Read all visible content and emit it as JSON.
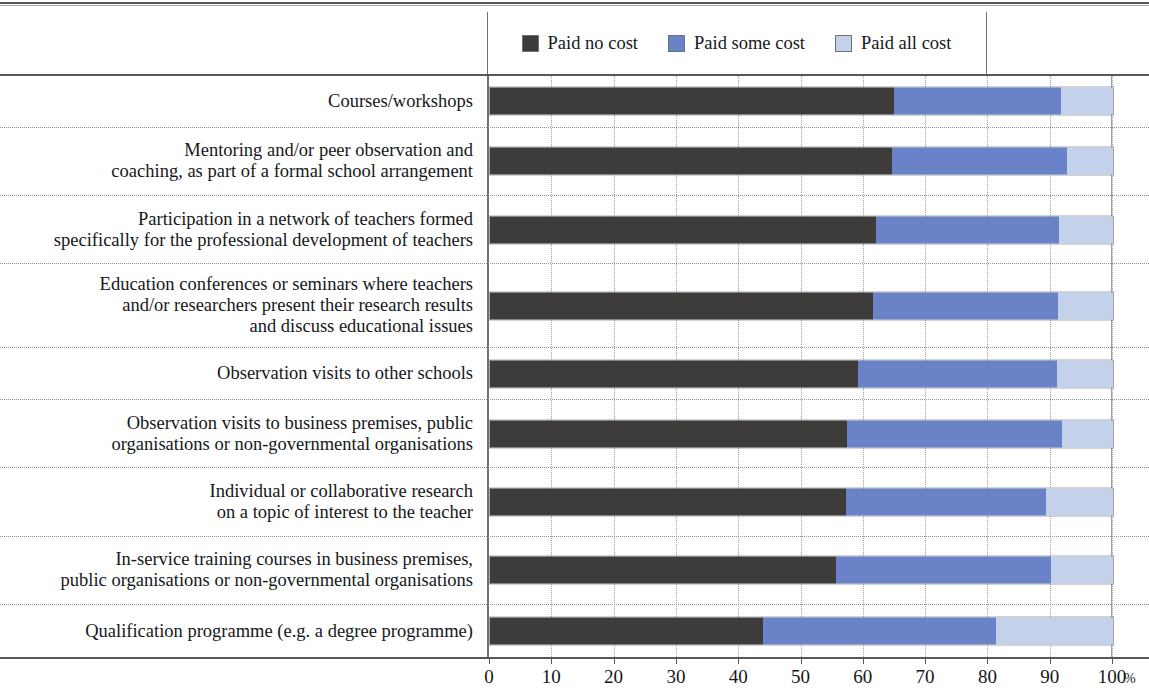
{
  "legend": {
    "items": [
      {
        "label": "Paid no cost",
        "color": "#3e3c3a",
        "icon": "legend-swatch-paid-no-cost"
      },
      {
        "label": "Paid some cost",
        "color": "#6a82c8",
        "icon": "legend-swatch-paid-some-cost"
      },
      {
        "label": "Paid all cost",
        "color": "#c3d2ea",
        "icon": "legend-swatch-paid-all-cost"
      }
    ]
  },
  "axis": {
    "unit": "%",
    "ticks": [
      "0",
      "10",
      "20",
      "30",
      "40",
      "50",
      "60",
      "70",
      "80",
      "90",
      "100"
    ]
  },
  "chart_data": {
    "type": "bar",
    "orientation": "horizontal",
    "stacked": true,
    "stack_total": 100,
    "title": "",
    "subtitle": "",
    "xlabel": "%",
    "ylabel": "",
    "xlim": [
      0,
      100
    ],
    "xticks": [
      0,
      10,
      20,
      30,
      40,
      50,
      60,
      70,
      80,
      90,
      100
    ],
    "grid": "vertical-dotted",
    "legend_position": "top-center",
    "categories": [
      "Courses/workshops",
      "Mentoring and/or peer observation and coaching, as part of a formal school arrangement",
      "Participation in a network of teachers formed specifically for the professional development of teachers",
      "Education conferences or seminars where teachers and/or researchers present their research results and discuss educational issues",
      "Observation visits to other schools",
      "Observation visits to business premises, public organisations or non-governmental organisations",
      "Individual or collaborative research on a topic of interest to the teacher",
      "In-service training courses in business premises, public organisations or non-governmental organisations",
      "Qualification programme (e.g. a degree programme)"
    ],
    "category_lines": [
      [
        "Courses/workshops"
      ],
      [
        "Mentoring and/or peer observation and",
        "coaching, as part of a formal school arrangement"
      ],
      [
        "Participation in a network of teachers formed",
        "specifically for the professional development of teachers"
      ],
      [
        "Education conferences or seminars where teachers",
        "and/or researchers present their research results",
        "and discuss educational issues"
      ],
      [
        "Observation visits to other schools"
      ],
      [
        "Observation visits to business premises, public",
        "organisations or non-governmental organisations"
      ],
      [
        "Individual or collaborative research",
        "on a topic of interest to the teacher"
      ],
      [
        "In-service training courses in business premises,",
        "public organisations or non-governmental organisations"
      ],
      [
        "Qualification programme (e.g. a degree programme)"
      ]
    ],
    "series": [
      {
        "name": "Paid no cost",
        "color": "#3e3c3a",
        "values": [
          64.8,
          64.6,
          61.9,
          61.4,
          59.1,
          57.3,
          57.1,
          55.6,
          43.8
        ]
      },
      {
        "name": "Paid some cost",
        "color": "#6a82c8",
        "values": [
          26.8,
          28.0,
          29.4,
          29.7,
          31.9,
          34.5,
          32.2,
          34.5,
          37.4
        ]
      },
      {
        "name": "Paid all cost",
        "color": "#c3d2ea",
        "values": [
          8.4,
          7.4,
          8.7,
          8.9,
          9.0,
          8.2,
          10.7,
          9.9,
          18.8
        ]
      }
    ],
    "cumulative_boundaries": [
      [
        64.8,
        91.6
      ],
      [
        64.6,
        92.6
      ],
      [
        61.9,
        91.3
      ],
      [
        61.4,
        91.1
      ],
      [
        59.1,
        91.0
      ],
      [
        57.3,
        91.8
      ],
      [
        57.1,
        89.3
      ],
      [
        55.6,
        90.1
      ],
      [
        43.8,
        81.2
      ]
    ]
  }
}
